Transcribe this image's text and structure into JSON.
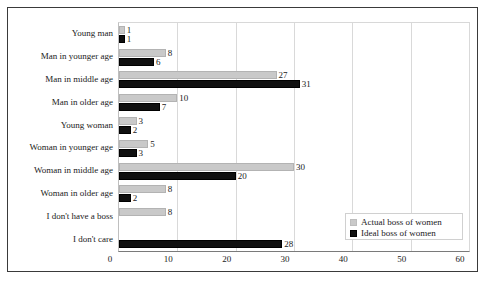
{
  "chart_data": {
    "type": "bar",
    "orientation": "horizontal",
    "title": "",
    "xlabel": "",
    "ylabel": "",
    "xlim": [
      0,
      60
    ],
    "xticks": [
      0,
      10,
      20,
      30,
      40,
      50,
      60
    ],
    "grid": true,
    "legend_position": "inside-bottom-right",
    "categories": [
      "Young man",
      "Man in younger age",
      "Man in middle age",
      "Man in older age",
      "Young woman",
      "Woman in younger age",
      "Woman in middle age",
      "Woman in older age",
      "I don't have a boss",
      "I don't care"
    ],
    "series": [
      {
        "name": "Actual boss of women",
        "color": "#c9c9c9",
        "values": [
          1,
          8,
          27,
          10,
          3,
          5,
          30,
          8,
          8,
          null
        ]
      },
      {
        "name": "Ideal boss of women",
        "color": "#101010",
        "values": [
          1,
          6,
          31,
          7,
          2,
          3,
          20,
          2,
          null,
          28
        ]
      }
    ]
  },
  "legend": {
    "items": [
      {
        "label": "Actual boss of women",
        "swatch": "actual"
      },
      {
        "label": "Ideal boss of women",
        "swatch": "ideal"
      }
    ]
  }
}
